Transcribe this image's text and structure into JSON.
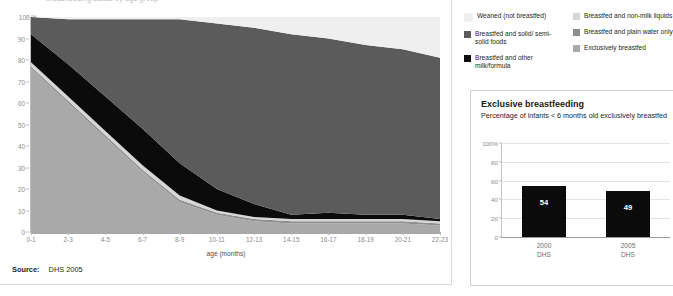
{
  "colors": {
    "weaned": "#eeeeee",
    "solid_foods": "#5b5b5b",
    "other_milk": "#0b0b0b",
    "non_milk_liquids": "#d6d6d6",
    "plain_water": "#8e8e8e",
    "exclusive": "#a9a9a9",
    "axis": "#8c8c8c",
    "panel_border": "#d9d9d9"
  },
  "clipped_heading": "breastfeeding status by age group",
  "source": {
    "label": "Source:",
    "value": "DHS 2005"
  },
  "legend": {
    "columns": [
      {
        "items": [
          {
            "label": "Weaned (not breastfed)",
            "color": "#efefef",
            "key": "weaned"
          },
          {
            "label": "Breastfed and solid/ semi- solid foods",
            "color": "#5b5b5b",
            "key": "solid_foods"
          },
          {
            "label": "Breastfed and other milk/formula",
            "color": "#0b0b0b",
            "key": "other_milk"
          }
        ]
      },
      {
        "items": [
          {
            "label": "Breastfed and non-milk liquids",
            "color": "#d6d6d6",
            "key": "non_milk_liquids"
          },
          {
            "label": "Breastfed and plain water only",
            "color": "#8e8e8e",
            "key": "plain_water"
          },
          {
            "label": "Exclusively breastfed",
            "color": "#a9a9a9",
            "key": "exclusive"
          }
        ]
      }
    ]
  },
  "right_panel": {
    "title": "Exclusive breastfeeding",
    "subtitle": "Percentage of infants < 6 months old exclusively breastfed"
  },
  "chart_data": [
    {
      "type": "area",
      "id": "breastfeeding-status-by-age",
      "title": "",
      "xlabel": "age (months)",
      "ylabel": "",
      "ylim": [
        0,
        100
      ],
      "yticks": [
        "0",
        "10",
        "20",
        "30",
        "40",
        "50",
        "60",
        "70",
        "80",
        "90",
        "100"
      ],
      "ytick_suffix_top": "%",
      "grid": false,
      "legend_position": "top-right",
      "stacked": true,
      "stack_order_bottom_to_top": [
        "exclusive",
        "plain_water",
        "non_milk_liquids",
        "other_milk",
        "solid_foods",
        "weaned"
      ],
      "categories": [
        "0-1",
        "2-3",
        "4-5",
        "6-7",
        "8-9",
        "10-11",
        "12-13",
        "14-15",
        "16-17",
        "18-19",
        "20-21",
        "22-23"
      ],
      "series": [
        {
          "name": "Exclusively breastfed",
          "key": "exclusive",
          "color": "#a9a9a9",
          "values": [
            76,
            60,
            44,
            28,
            14,
            8,
            5,
            4,
            4,
            4,
            4,
            3
          ]
        },
        {
          "name": "Breastfed and plain water only",
          "key": "plain_water",
          "color": "#8e8e8e",
          "values": [
            1,
            1,
            1,
            1,
            1,
            1,
            1,
            1,
            1,
            1,
            1,
            1
          ]
        },
        {
          "name": "Breastfed and non-milk liquids",
          "key": "non_milk_liquids",
          "color": "#d6d6d6",
          "values": [
            2,
            2,
            2,
            2,
            2,
            1,
            1,
            1,
            1,
            1,
            1,
            1
          ]
        },
        {
          "name": "Breastfed and other milk/formula",
          "key": "other_milk",
          "color": "#0b0b0b",
          "values": [
            13,
            15,
            16,
            17,
            15,
            10,
            6,
            2,
            3,
            2,
            2,
            1
          ]
        },
        {
          "name": "Breastfed and solid/semi-solid foods",
          "key": "solid_foods",
          "color": "#5b5b5b",
          "values": [
            8,
            21,
            36,
            51,
            67,
            77,
            82,
            84,
            81,
            79,
            77,
            75
          ]
        },
        {
          "name": "Weaned (not breastfed)",
          "key": "weaned",
          "color": "#efefef",
          "values": [
            0,
            1,
            1,
            1,
            1,
            3,
            5,
            8,
            10,
            13,
            15,
            19
          ]
        }
      ]
    },
    {
      "type": "bar",
      "id": "exclusive-breastfeeding-trend",
      "title": "Exclusive breastfeeding",
      "subtitle": "Percentage of infants < 6 months old exclusively breastfed",
      "xlabel": "",
      "ylabel": "",
      "ylim": [
        0,
        100
      ],
      "yticks": [
        "0",
        "20",
        "40",
        "60",
        "80",
        "100%"
      ],
      "grid": true,
      "bar_color": "#0b0b0b",
      "categories": [
        "2000",
        "2005"
      ],
      "category_sublabels": [
        "DHS",
        "DHS"
      ],
      "values": [
        54,
        49
      ],
      "value_labels": [
        "54",
        "49"
      ]
    }
  ]
}
